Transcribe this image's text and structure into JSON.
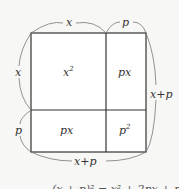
{
  "diagram": {
    "top_labels": {
      "left": "x",
      "right": "p"
    },
    "side_labels": {
      "left_top": "x",
      "left_bottom": "p",
      "right": "x+p",
      "bottom": "x+p"
    },
    "cells": {
      "top_left": {
        "base": "x",
        "exp": "2"
      },
      "top_right": "px",
      "bottom_left": "px",
      "bottom_right": {
        "base": "p",
        "exp": "2"
      }
    },
    "formula": "(x + p)² = x² + 2px + p²",
    "colors": {
      "line": "#333333",
      "background": "#f7f7f5",
      "cell": "#ffffff"
    }
  }
}
